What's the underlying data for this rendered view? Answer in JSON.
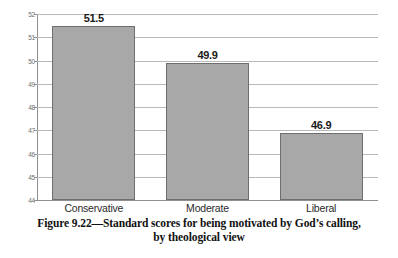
{
  "figure": {
    "caption_line1": "Figure 9.22—Standard scores for being motivated by God’s calling,",
    "caption_line2": "by theological view"
  },
  "colors": {
    "bar_fill": "#a8a8a8",
    "bar_border": "#6e6e6e",
    "gridline": "#b9b9b9",
    "axis": "#8f8f8f",
    "tick_text": "#6d6d6d",
    "label_text": "#1a1a1a",
    "background": "#ffffff"
  },
  "chart_data": {
    "type": "bar",
    "title": "",
    "subtitle": "",
    "categories": [
      "Conservative",
      "Moderate",
      "Liberal"
    ],
    "values": [
      51.5,
      49.9,
      46.9
    ],
    "value_labels": [
      "51.5",
      "49.9",
      "46.9"
    ],
    "xlabel": "",
    "ylabel": "",
    "ylim": [
      44,
      52
    ],
    "yticks": [
      52,
      51,
      50,
      49,
      48,
      47,
      46,
      45,
      44
    ],
    "ytick_labels": [
      "52",
      "51",
      "50",
      "49",
      "48",
      "47",
      "46",
      "45",
      "44"
    ],
    "grid": true,
    "legend": false,
    "legend_position": "none"
  }
}
